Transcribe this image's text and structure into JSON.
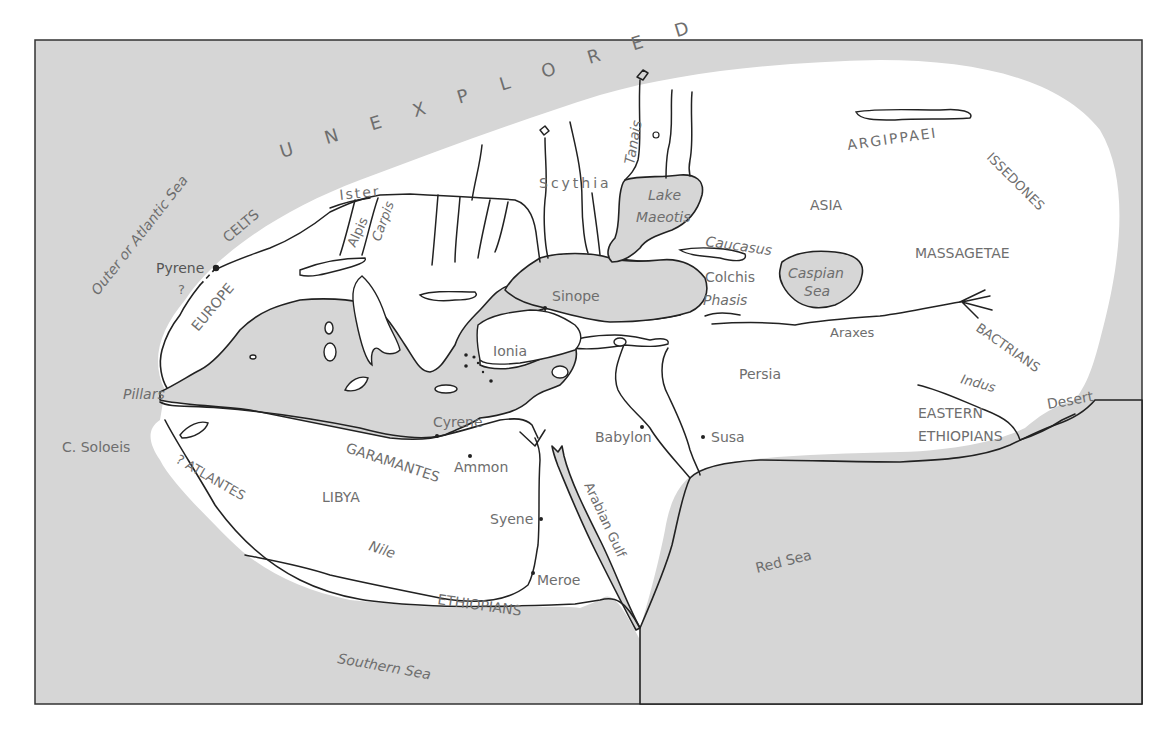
{
  "map": {
    "colors": {
      "sea": "#d6d6d6",
      "land": "#ffffff",
      "outline": "#222222",
      "label": "#6e6e6e",
      "frame": "#333333"
    },
    "regions": {
      "unexplored": "U N E X P L O R E D",
      "europe": "EUROPE",
      "celts": "CELTS",
      "asia": "ASIA",
      "libya": "LIBYA",
      "persia": "Persia",
      "scythia": "Scythia",
      "ionia": "Ionia",
      "argippaei": "ARGIPPAEI",
      "issedones": "ISSEDONES",
      "massagetae": "MASSAGETAE",
      "bactrians": "BACTRIANS",
      "eastern_ethiopians_1": "EASTERN",
      "eastern_ethiopians_2": "ETHIOPIANS",
      "garamantes": "GARAMANTES",
      "atlantes": "? ATLANTES",
      "ethiopians": "ETHIOPIANS",
      "desert": "Desert",
      "colchis": "Colchis"
    },
    "seas": {
      "outer_atlantic": "Outer or Atlantic Sea",
      "southern": "Southern Sea",
      "red": "Red Sea",
      "arabian_gulf": "Arabian Gulf",
      "caspian_1": "Caspian",
      "caspian_2": "Sea",
      "maeotis_1": "Lake",
      "maeotis_2": "Maeotis"
    },
    "rivers": {
      "ister": "Ister",
      "tanais": "Tanais",
      "nile": "Nile",
      "araxes": "Araxes",
      "indus": "Indus",
      "phasis": "Phasis",
      "alpis": "Alpis",
      "carpis": "Carpis"
    },
    "mountains": {
      "caucasus": "Caucasus"
    },
    "places": {
      "pyrene": "Pyrene",
      "pyrene_q": "?",
      "pillars": "Pillars",
      "c_soloeis": "C. Soloeis",
      "sinope": "Sinope",
      "cyrene": "Cyrene",
      "ammon": "Ammon",
      "syene": "Syene",
      "meroe": "Meroe",
      "babylon": "Babylon",
      "susa": "Susa"
    }
  }
}
